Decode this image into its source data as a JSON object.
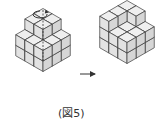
{
  "figure": {
    "caption": "(図5)",
    "left_solid": {
      "label": "cube stack before rotation",
      "rotation_axis": "vertical dashed axis with circular arrow",
      "heights": [
        [
          3,
          3,
          2
        ],
        [
          3,
          3,
          2
        ],
        [
          2,
          2,
          2
        ]
      ]
    },
    "arrow": "right-arrow",
    "right_solid": {
      "label": "cube stack after rotation",
      "heights": [
        [
          3,
          3,
          2
        ],
        [
          3,
          2,
          2
        ],
        [
          3,
          2,
          2
        ]
      ]
    },
    "colors": {
      "face_top": "#efefef",
      "face_left": "#e2e2e2",
      "face_right": "#d6d6d6",
      "stroke": "#3a3a3a"
    }
  }
}
